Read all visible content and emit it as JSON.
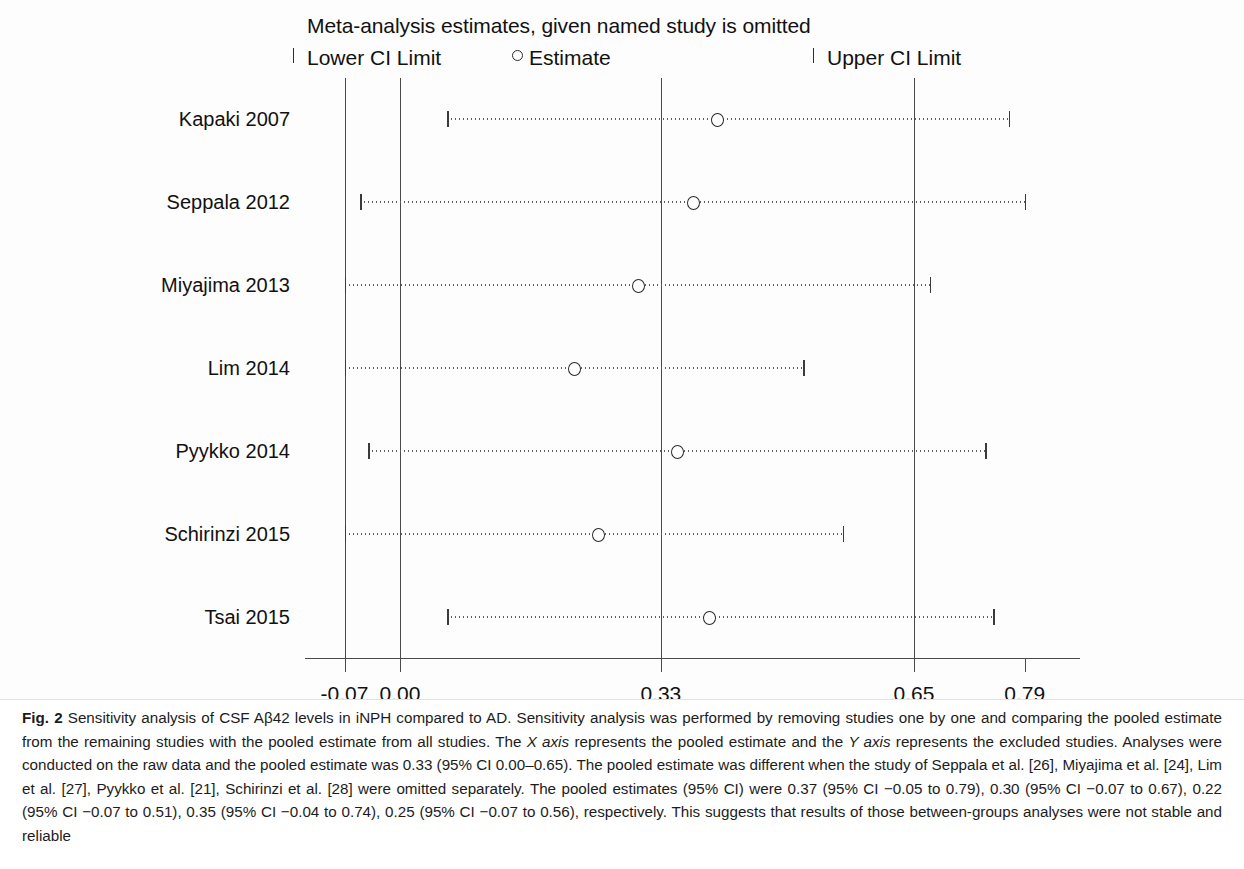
{
  "figure": {
    "label": "Fig. 2",
    "chart_title": "Meta-analysis estimates, given named study is omitted",
    "legend": {
      "lower": "Lower CI Limit",
      "estimate": "Estimate",
      "upper": "Upper CI Limit"
    },
    "caption_text": " Sensitivity analysis of CSF Aβ42 levels in iNPH compared to AD. Sensitivity analysis was performed by removing studies one by one and comparing the pooled estimate from the remaining studies with the pooled estimate from all studies. The ",
    "caption_x_axis": "X axis",
    "caption_part2": " represents the pooled estimate and the ",
    "caption_y_axis": "Y axis",
    "caption_part3": " represents the excluded studies. Analyses were conducted on the raw data and the pooled estimate was 0.33 (95% CI 0.00–0.65). The pooled estimate was different when the study of Seppala et al. [26], Miyajima et al. [24], Lim et al. [27], Pyykko et al. [21], Schirinzi et al. [28] were omitted separately. The pooled estimates (95% CI) were 0.37 (95% CI −0.05 to 0.79), 0.30 (95% CI −0.07 to 0.67), 0.22 (95% CI −0.07 to 0.51), 0.35 (95% CI −0.04 to 0.74), 0.25 (95% CI −0.07 to 0.56), respectively. This suggests that results of those between-groups analyses were not stable and reliable"
  },
  "chart_data": {
    "type": "scatter",
    "title": "Meta-analysis estimates, given named study is omitted",
    "xlabel": "",
    "ylabel": "",
    "xlim": [
      -0.12,
      0.86
    ],
    "xticks": [
      -0.07,
      0.0,
      0.33,
      0.65,
      0.79
    ],
    "xticklabels": [
      "-0.07",
      "0.00",
      "0.33",
      "0.65",
      "0.79"
    ],
    "gridlines_x": [
      -0.07,
      0.0,
      0.33,
      0.65
    ],
    "grid": true,
    "legend_position": "top",
    "categories": [
      "Kapaki 2007",
      "Seppala 2012",
      "Miyajima 2013",
      "Lim 2014",
      "Pyykko 2014",
      "Schirinzi 2015",
      "Tsai 2015"
    ],
    "series": [
      {
        "name": "Estimate",
        "values": [
          0.4,
          0.37,
          0.3,
          0.22,
          0.35,
          0.25,
          0.39
        ]
      },
      {
        "name": "Lower CI Limit",
        "values": [
          0.06,
          -0.05,
          -0.07,
          -0.07,
          -0.04,
          -0.07,
          0.06
        ]
      },
      {
        "name": "Upper CI Limit",
        "values": [
          0.77,
          0.79,
          0.67,
          0.51,
          0.74,
          0.56,
          0.75
        ]
      }
    ],
    "points": [
      {
        "study": "Kapaki 2007",
        "estimate": 0.4,
        "lower": 0.06,
        "upper": 0.77
      },
      {
        "study": "Seppala 2012",
        "estimate": 0.37,
        "lower": -0.05,
        "upper": 0.79
      },
      {
        "study": "Miyajima 2013",
        "estimate": 0.3,
        "lower": -0.07,
        "upper": 0.67
      },
      {
        "study": "Lim 2014",
        "estimate": 0.22,
        "lower": -0.07,
        "upper": 0.51
      },
      {
        "study": "Pyykko 2014",
        "estimate": 0.35,
        "lower": -0.04,
        "upper": 0.74
      },
      {
        "study": "Schirinzi 2015",
        "estimate": 0.25,
        "lower": -0.07,
        "upper": 0.56
      },
      {
        "study": "Tsai 2015",
        "estimate": 0.39,
        "lower": 0.06,
        "upper": 0.75
      }
    ],
    "pooled_estimate": 0.33,
    "pooled_ci": [
      0.0,
      0.65
    ]
  },
  "colors": {
    "axis": "#4a4a4a",
    "marker": "#2b2b2b",
    "ci": "#5d5d5d",
    "text": "#111111",
    "background": "#ffffff"
  }
}
